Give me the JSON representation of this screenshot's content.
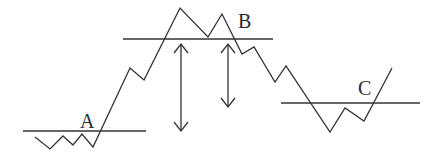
{
  "diagram": {
    "type": "price-chart-schematic",
    "levels": [
      {
        "id": "A",
        "label": "A"
      },
      {
        "id": "B",
        "label": "B"
      },
      {
        "id": "C",
        "label": "C"
      }
    ],
    "arrows": [
      {
        "id": "arrow-1",
        "kind": "double-headed vertical"
      },
      {
        "id": "arrow-2",
        "kind": "double-headed vertical"
      }
    ],
    "colors": {
      "stroke": "#333333",
      "background": "#ffffff"
    }
  }
}
